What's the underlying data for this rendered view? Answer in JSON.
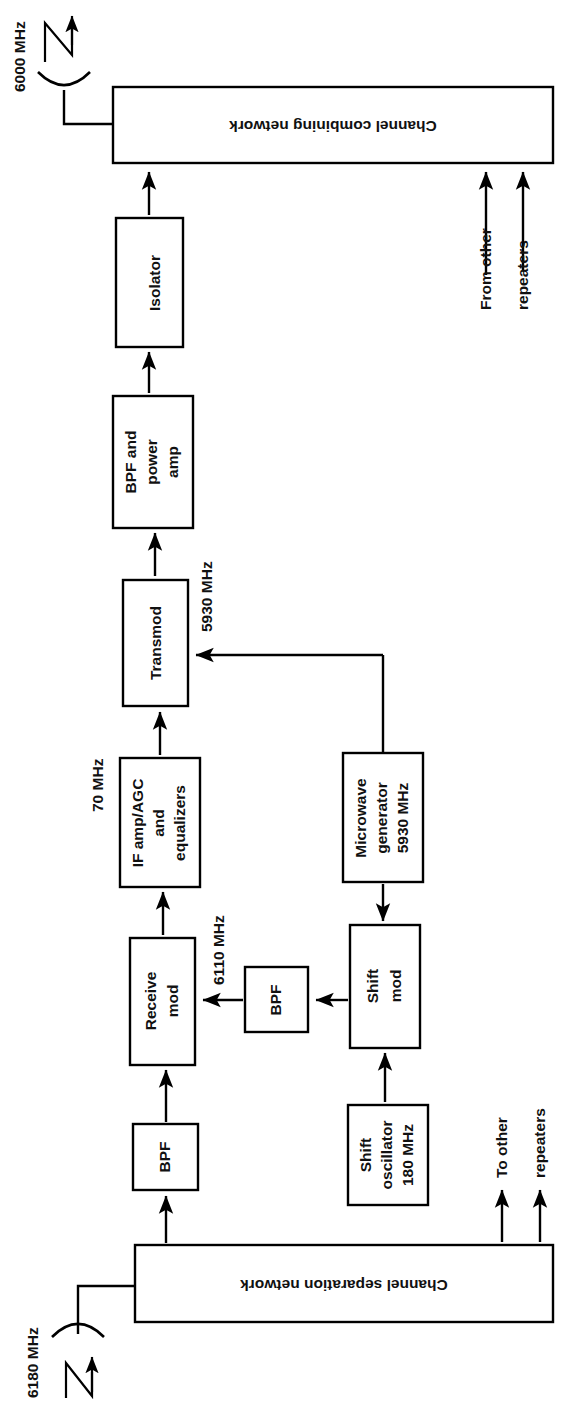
{
  "diagram": {
    "orientation": "rotated-90-ccw",
    "stroke_color": "#000000",
    "background_color": "#ffffff",
    "blocks": {
      "channel_combining_network": "Channel combining network",
      "isolator": "Isolator",
      "bpf_and_power_amp": "BPF and\npower\namp",
      "bpf_power_amp_line1": "BPF and",
      "bpf_power_amp_line2": "power",
      "bpf_power_amp_line3": "amp",
      "transmod": "Transmod",
      "if_amp_line1": "IF amp/AGC",
      "if_amp_line2": "and",
      "if_amp_line3": "equalizers",
      "receive_mod_line1": "Receive",
      "receive_mod_line2": "mod",
      "bpf_mid": "BPF",
      "bpf_bottom": "BPF",
      "microwave_generator_line1": "Microwave",
      "microwave_generator_line2": "generator",
      "microwave_generator_line3": "5930 MHz",
      "shift_mod_line1": "Shift",
      "shift_mod_line2": "mod",
      "shift_oscillator_line1": "Shift",
      "shift_oscillator_line2": "oscillator",
      "shift_oscillator_line3": "180 MHz",
      "channel_separation_network": "Channel separation network"
    },
    "labels": {
      "antenna_tx_freq": "6000 MHz",
      "antenna_rx_freq": "6180 MHz",
      "freq_5930": "5930 MHz",
      "freq_70": "70 MHz",
      "freq_6110": "6110 MHz",
      "from_other_line1": "From other",
      "from_other_line2": "repeaters",
      "to_other_line1": "To other",
      "to_other_line2": "repeaters"
    }
  }
}
